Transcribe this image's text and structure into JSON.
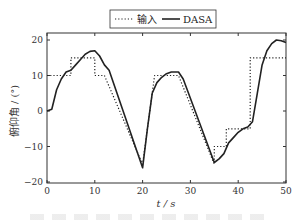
{
  "chart_data": {
    "type": "line",
    "title": "",
    "xlabel": "t / s",
    "ylabel": "俯仰角 / (°)",
    "xlim": [
      0,
      50
    ],
    "ylim": [
      -20,
      20
    ],
    "xticks": [
      0,
      10,
      20,
      30,
      40,
      50
    ],
    "yticks": [
      -20,
      -10,
      0,
      10,
      20
    ],
    "xtick_labels": [
      "0",
      "10",
      "20",
      "30",
      "40",
      "50"
    ],
    "ytick_labels": [
      "−20",
      "−10",
      "0",
      "10",
      "20"
    ],
    "grid": false,
    "legend_position": "top-center, outside plot",
    "series": [
      {
        "name": "输入",
        "style": "dotted",
        "x": [
          0,
          5,
          5,
          10,
          10,
          12,
          20,
          22.5,
          27.5,
          35,
          35,
          37.5,
          37.5,
          42.5,
          42.5,
          50
        ],
        "y": [
          10,
          10,
          15,
          15,
          10,
          10,
          -15,
          10,
          10,
          -15,
          -10,
          -10,
          -5,
          -5,
          15,
          15
        ]
      },
      {
        "name": "DASA",
        "style": "solid",
        "x": [
          0,
          1,
          2,
          3,
          4,
          5,
          6,
          7,
          8,
          9,
          10,
          11,
          12,
          13,
          20,
          21,
          22,
          23,
          24,
          25,
          26,
          27.5,
          28.5,
          35,
          36,
          37,
          38,
          39,
          40,
          41,
          42,
          43,
          44,
          45,
          46,
          47,
          48,
          49,
          50
        ],
        "y": [
          0,
          0.5,
          6,
          9,
          11,
          11.5,
          13,
          14.5,
          16,
          16.8,
          17,
          15.5,
          13,
          11.5,
          -16,
          -5,
          5,
          8,
          9.5,
          10.5,
          11,
          11,
          9,
          -14.5,
          -13.5,
          -12,
          -9,
          -7.5,
          -6,
          -5,
          -4.5,
          -3,
          5,
          13,
          17,
          19,
          20,
          19.8,
          19.3
        ]
      }
    ]
  },
  "legend": {
    "items": [
      {
        "label": "输入",
        "style": "dotted"
      },
      {
        "label": "DASA",
        "style": "solid"
      }
    ]
  },
  "axes": {
    "xlabel": "t / s",
    "ylabel": "俯仰角 / (°)"
  },
  "colors": {
    "line": "#222222",
    "axis": "#333333"
  }
}
